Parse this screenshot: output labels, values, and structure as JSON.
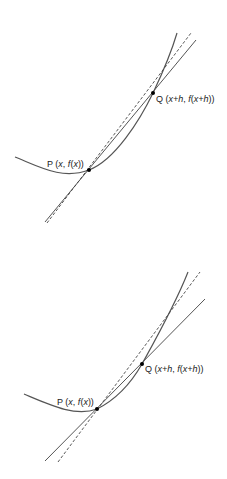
{
  "figures": [
    {
      "id": "top",
      "description": "Curve with secant PQ and tangent at P, larger h",
      "curve_color": "#555555",
      "secant_color": "#555555",
      "tangent_color": "#444444",
      "labels": {
        "P": {
          "point": "P",
          "open": " (",
          "x": "x",
          "sep": ", ",
          "f": "f",
          "fo": "(",
          "fx": "x",
          "close": "))"
        },
        "Q": {
          "point": "Q",
          "open": " (",
          "xh": "x+h",
          "sep": ", ",
          "f": "f",
          "fo": "(",
          "fxh": "x+h",
          "close": "))"
        }
      }
    },
    {
      "id": "bottom",
      "description": "Curve with secant PQ and tangent at P, smaller h",
      "curve_color": "#555555",
      "secant_color": "#555555",
      "tangent_color": "#444444",
      "labels": {
        "P": {
          "point": "P",
          "open": " (",
          "x": "x",
          "sep": ", ",
          "f": "f",
          "fo": "(",
          "fx": "x",
          "close": "))"
        },
        "Q": {
          "point": "Q",
          "open": " (",
          "xh": "x+h",
          "sep": ", ",
          "f": "f",
          "fo": "(",
          "fxh": "x+h",
          "close": "))"
        }
      }
    }
  ]
}
